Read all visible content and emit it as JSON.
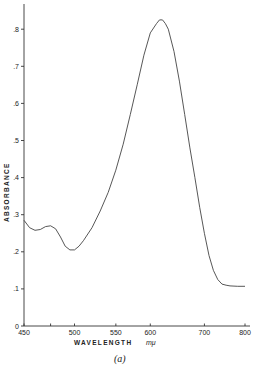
{
  "chart_data": {
    "type": "line",
    "title": "",
    "caption": "(a)",
    "xlabel": "WAVELENGTH",
    "xlabel_unit": "mμ",
    "ylabel": "ABSORBANCE",
    "x_scale": "reciprocal (wavenumber-linear)",
    "xlim": [
      450,
      800
    ],
    "ylim": [
      0,
      0.85
    ],
    "grid": false,
    "legend": null,
    "x_ticks": [
      450,
      475,
      500,
      550,
      600,
      700,
      800
    ],
    "x_tick_labels": [
      "450",
      "",
      "500",
      "550",
      "600",
      "700",
      "800"
    ],
    "y_ticks": [
      0,
      0.1,
      0.2,
      0.3,
      0.4,
      0.5,
      0.6,
      0.7,
      0.8
    ],
    "y_tick_labels": [
      "0",
      ".1",
      ".2",
      ".3",
      ".4",
      ".5",
      ".6",
      ".7",
      ".8"
    ],
    "series": [
      {
        "name": "absorbance",
        "x": [
          450,
          455,
          460,
          465,
          470,
          475,
          480,
          485,
          490,
          495,
          500,
          505,
          510,
          520,
          530,
          540,
          550,
          560,
          570,
          580,
          590,
          600,
          610,
          615,
          620,
          625,
          630,
          640,
          650,
          660,
          670,
          680,
          690,
          700,
          710,
          720,
          730,
          740,
          750,
          760,
          780,
          800
        ],
        "y": [
          0.285,
          0.265,
          0.258,
          0.26,
          0.268,
          0.27,
          0.262,
          0.24,
          0.215,
          0.205,
          0.205,
          0.215,
          0.23,
          0.265,
          0.31,
          0.36,
          0.42,
          0.49,
          0.57,
          0.65,
          0.73,
          0.79,
          0.815,
          0.825,
          0.825,
          0.815,
          0.8,
          0.74,
          0.66,
          0.57,
          0.48,
          0.4,
          0.32,
          0.25,
          0.19,
          0.15,
          0.125,
          0.113,
          0.11,
          0.108,
          0.107,
          0.107
        ]
      }
    ]
  }
}
